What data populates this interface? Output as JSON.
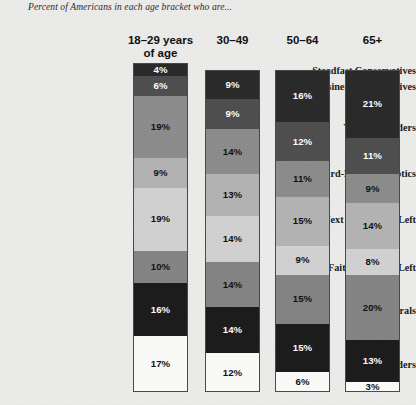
{
  "title": "Percent of Americans in each age bracket who are...",
  "chart_data": {
    "type": "bar",
    "title": "Percent of Americans in each age bracket who are...",
    "subtitle": "",
    "xlabel": "",
    "ylabel": "",
    "orientation": "vertical-stacked",
    "stacked": true,
    "grid": false,
    "legend_position": "none",
    "value_suffix": "%",
    "categories": [
      "18–29 years of age",
      "30–49",
      "50–64",
      "65+"
    ],
    "groups": [
      "Steadfast Conservatives",
      "Business Conservatives",
      "Young Outsiders",
      "Hard-Pressed Skeptics",
      "Next Generation Left",
      "Faith & Family Left",
      "Solid Liberals",
      "Bystanders"
    ],
    "series": [
      {
        "name": "Steadfast Conservatives",
        "values": [
          4,
          9,
          16,
          21
        ],
        "color": "#2b2b2b"
      },
      {
        "name": "Business Conservatives",
        "values": [
          6,
          9,
          12,
          11
        ],
        "color": "#4f4f4f"
      },
      {
        "name": "Young Outsiders",
        "values": [
          19,
          14,
          11,
          9
        ],
        "color": "#8d8d8d"
      },
      {
        "name": "Hard-Pressed Skeptics",
        "values": [
          9,
          13,
          15,
          14
        ],
        "color": "#b4b4b4"
      },
      {
        "name": "Next Generation Left",
        "values": [
          19,
          14,
          9,
          8
        ],
        "color": "#d2d2d2"
      },
      {
        "name": "Faith & Family Left",
        "values": [
          10,
          14,
          15,
          20
        ],
        "color": "#858585"
      },
      {
        "name": "Solid Liberals",
        "values": [
          16,
          14,
          15,
          13
        ],
        "color": "#1d1d1d"
      },
      {
        "name": "Bystanders",
        "values": [
          17,
          12,
          6,
          3
        ],
        "color": "#fbfbf9"
      }
    ],
    "column_totals": [
      100,
      99,
      99,
      99
    ],
    "ylim": [
      0,
      100
    ]
  },
  "headers": [
    {
      "line1": "18–29 years",
      "line2": "of age"
    },
    {
      "line1": "30–49",
      "line2": ""
    },
    {
      "line1": "50–64",
      "line2": ""
    },
    {
      "line1": "65+",
      "line2": ""
    }
  ],
  "row_labels": [
    "Steadfast Conservatives",
    "Business Conservatives",
    "Young Outsiders",
    "Hard-Pressed Skeptics",
    "Next Generation Left",
    "Faith & Family Left",
    "Solid Liberals",
    "Bystanders"
  ],
  "columns": [
    {
      "name": "18-29",
      "segments": [
        {
          "label": "4%",
          "value": 4,
          "color": "#2b2b2b",
          "text": "#ffffff"
        },
        {
          "label": "6%",
          "value": 6,
          "color": "#4f4f4f",
          "text": "#ffffff"
        },
        {
          "label": "19%",
          "value": 19,
          "color": "#8d8d8d",
          "text": "#111111"
        },
        {
          "label": "9%",
          "value": 9,
          "color": "#b4b4b4",
          "text": "#111111"
        },
        {
          "label": "19%",
          "value": 19,
          "color": "#d2d2d2",
          "text": "#111111"
        },
        {
          "label": "10%",
          "value": 10,
          "color": "#858585",
          "text": "#111111"
        },
        {
          "label": "16%",
          "value": 16,
          "color": "#1d1d1d",
          "text": "#ffffff"
        },
        {
          "label": "17%",
          "value": 17,
          "color": "#fbfbf9",
          "text": "#111111"
        }
      ]
    },
    {
      "name": "30-49",
      "segments": [
        {
          "label": "9%",
          "value": 9,
          "color": "#2b2b2b",
          "text": "#ffffff"
        },
        {
          "label": "9%",
          "value": 9,
          "color": "#4f4f4f",
          "text": "#ffffff"
        },
        {
          "label": "14%",
          "value": 14,
          "color": "#8d8d8d",
          "text": "#111111"
        },
        {
          "label": "13%",
          "value": 13,
          "color": "#b4b4b4",
          "text": "#111111"
        },
        {
          "label": "14%",
          "value": 14,
          "color": "#d2d2d2",
          "text": "#111111"
        },
        {
          "label": "14%",
          "value": 14,
          "color": "#858585",
          "text": "#111111"
        },
        {
          "label": "14%",
          "value": 14,
          "color": "#1d1d1d",
          "text": "#ffffff"
        },
        {
          "label": "12%",
          "value": 12,
          "color": "#fbfbf9",
          "text": "#111111"
        }
      ]
    },
    {
      "name": "50-64",
      "segments": [
        {
          "label": "16%",
          "value": 16,
          "color": "#2b2b2b",
          "text": "#ffffff"
        },
        {
          "label": "12%",
          "value": 12,
          "color": "#4f4f4f",
          "text": "#ffffff"
        },
        {
          "label": "11%",
          "value": 11,
          "color": "#8d8d8d",
          "text": "#111111"
        },
        {
          "label": "15%",
          "value": 15,
          "color": "#b4b4b4",
          "text": "#111111"
        },
        {
          "label": "9%",
          "value": 9,
          "color": "#d2d2d2",
          "text": "#111111"
        },
        {
          "label": "15%",
          "value": 15,
          "color": "#858585",
          "text": "#111111"
        },
        {
          "label": "15%",
          "value": 15,
          "color": "#1d1d1d",
          "text": "#ffffff"
        },
        {
          "label": "6%",
          "value": 6,
          "color": "#fbfbf9",
          "text": "#111111"
        }
      ]
    },
    {
      "name": "65plus",
      "segments": [
        {
          "label": "21%",
          "value": 21,
          "color": "#2b2b2b",
          "text": "#ffffff"
        },
        {
          "label": "11%",
          "value": 11,
          "color": "#4f4f4f",
          "text": "#ffffff"
        },
        {
          "label": "9%",
          "value": 9,
          "color": "#8d8d8d",
          "text": "#111111"
        },
        {
          "label": "14%",
          "value": 14,
          "color": "#b4b4b4",
          "text": "#111111"
        },
        {
          "label": "8%",
          "value": 8,
          "color": "#d2d2d2",
          "text": "#111111"
        },
        {
          "label": "20%",
          "value": 20,
          "color": "#858585",
          "text": "#111111"
        },
        {
          "label": "13%",
          "value": 13,
          "color": "#1d1d1d",
          "text": "#ffffff"
        },
        {
          "label": "3%",
          "value": 3,
          "color": "#fbfbf9",
          "text": "#111111"
        }
      ]
    }
  ],
  "colors": {
    "background": "#ececeb",
    "outline": "#4a4a4a",
    "title_text": "#2b2b2b",
    "header_text": "#111111",
    "row_label_text": "#1a1a1a"
  }
}
